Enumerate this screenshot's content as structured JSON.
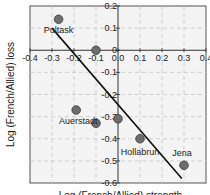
{
  "chart_data": {
    "type": "scatter",
    "title": "",
    "xlabel": "Log (French/Allied) strength ...",
    "ylabel": "Log (French/Allied) loss",
    "xlim": [
      -0.4,
      0.4
    ],
    "ylim": [
      -0.6,
      0.2
    ],
    "grid": true,
    "x_ticks": [
      "-0.4",
      "-0.3",
      "-0.2",
      "-0.1",
      "0.0",
      "0.1",
      "0.2",
      "0.3",
      "0.4"
    ],
    "y_ticks": [
      "0.2",
      "0.1",
      "0",
      "-0.1",
      "-0.2",
      "-0.3",
      "-0.4",
      "-0.5",
      "-0.6"
    ],
    "points": [
      {
        "label": "Pultask",
        "x": -0.27,
        "y": 0.14
      },
      {
        "label": "",
        "x": -0.1,
        "y": 0.0
      },
      {
        "label": "Auerstadt",
        "x": -0.19,
        "y": -0.27
      },
      {
        "label": "",
        "x": -0.1,
        "y": -0.33
      },
      {
        "label": "",
        "x": 0.0,
        "y": -0.31
      },
      {
        "label": "Hollabrun",
        "x": 0.1,
        "y": -0.4
      },
      {
        "label": "Jena",
        "x": 0.3,
        "y": -0.52
      }
    ],
    "fit_line": {
      "x1": -0.3,
      "y1": 0.1,
      "x2": 0.29,
      "y2": -0.58
    },
    "colors": {
      "point": "#6e6e6e",
      "point_edge": "#3a3a3a",
      "line": "#111111",
      "grid": "#c8c8c8",
      "plot_bg": "#f4f4f4"
    }
  }
}
